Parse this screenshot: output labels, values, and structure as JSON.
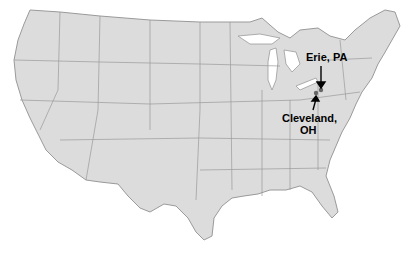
{
  "map": {
    "region": "United States",
    "colors": {
      "land": "#dcdcdc",
      "border": "#9a9a9a",
      "marker": "#666666",
      "text": "#000000"
    },
    "locations": [
      {
        "name": "Erie, PA",
        "label": "Erie, PA"
      },
      {
        "name": "Cleveland, OH",
        "label_line1": "Cleveland,",
        "label_line2": "OH"
      }
    ]
  }
}
